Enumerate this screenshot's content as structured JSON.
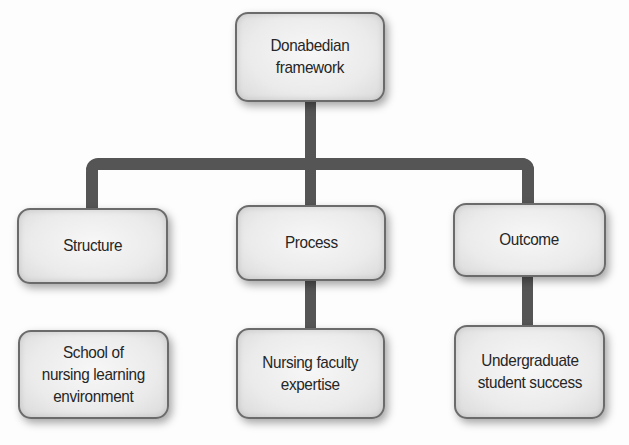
{
  "diagram": {
    "type": "hierarchy",
    "root": {
      "label": "Donabedian\nframework"
    },
    "categories": [
      {
        "label": "Structure",
        "detail": "School of\nnursing learning\nenvironment",
        "detail_connected": false
      },
      {
        "label": "Process",
        "detail": "Nursing faculty\nexpertise",
        "detail_connected": true
      },
      {
        "label": "Outcome",
        "detail": "Undergraduate\nstudent success",
        "detail_connected": true
      }
    ]
  },
  "colors": {
    "connector": "#555555",
    "node_fill": "#ebebeb",
    "node_border": "#6b6b6b",
    "text": "#262626",
    "background": "#fdfdfd"
  }
}
